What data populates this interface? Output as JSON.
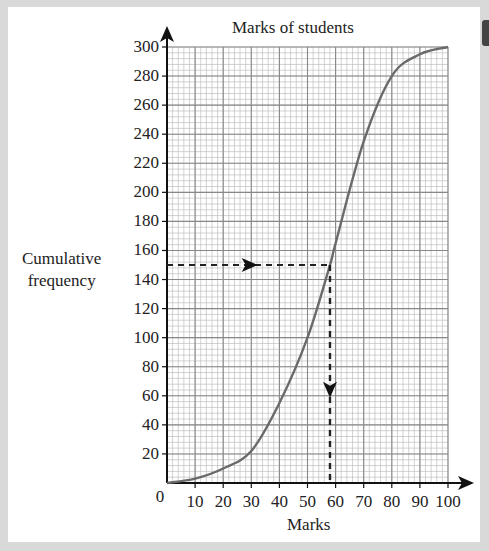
{
  "chart_data": {
    "type": "line",
    "title": "Marks of students",
    "xlabel": "Marks",
    "ylabel": "Cumulative frequency",
    "xlim": [
      0,
      100
    ],
    "ylim": [
      0,
      300
    ],
    "x_ticks": [
      0,
      10,
      20,
      30,
      40,
      50,
      60,
      70,
      80,
      90,
      100
    ],
    "y_ticks": [
      20,
      40,
      60,
      80,
      100,
      120,
      140,
      160,
      180,
      200,
      220,
      240,
      260,
      280,
      300
    ],
    "grid": true,
    "series": [
      {
        "name": "Cumulative frequency curve",
        "x": [
          0,
          10,
          20,
          30,
          40,
          50,
          58,
          60,
          70,
          80,
          90,
          100
        ],
        "y": [
          0,
          3,
          10,
          22,
          55,
          100,
          150,
          165,
          235,
          280,
          295,
          300
        ]
      }
    ],
    "annotations": [
      {
        "type": "dashed-arrow",
        "from": [
          0,
          150
        ],
        "to": [
          58,
          150
        ],
        "direction": "right"
      },
      {
        "type": "dashed-arrow",
        "from": [
          58,
          150
        ],
        "to": [
          58,
          0
        ],
        "direction": "down"
      }
    ]
  },
  "labels": {
    "title": "Marks of students",
    "ylabel_line1": "Cumulative",
    "ylabel_line2": "frequency",
    "xlabel": "Marks",
    "origin": "0"
  },
  "colors": {
    "curve": "#6a6a6a",
    "grid_major": "#888888",
    "grid_minor": "#b5b5b5",
    "axis": "#111111",
    "background": "#ffffff",
    "frame": "#d9d9d9"
  }
}
